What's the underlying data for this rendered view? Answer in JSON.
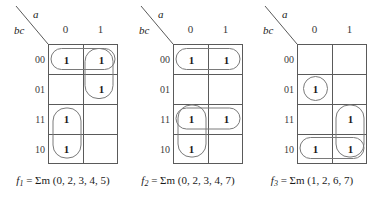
{
  "figure": {
    "type": "karnaugh-maps",
    "count": 3,
    "variables": {
      "column": "a",
      "row": "bc"
    },
    "column_headers": [
      "0",
      "1"
    ],
    "row_headers": [
      "00",
      "01",
      "11",
      "10"
    ],
    "one_label": "1",
    "line_color": "#5a5a5a",
    "group_color": "#7a7a7a",
    "text_color": "#1a1a1a"
  },
  "maps": [
    {
      "id": "map-1",
      "name": "f1",
      "caption": {
        "fn": "f",
        "sub": "1",
        "rest": " = Σm (0, 2, 3, 4, 5)"
      },
      "minterms": [
        0,
        2,
        3,
        4,
        5
      ],
      "cells": [
        {
          "row": "00",
          "col": "0",
          "value": "1"
        },
        {
          "row": "00",
          "col": "1",
          "value": "1"
        },
        {
          "row": "01",
          "col": "0",
          "value": ""
        },
        {
          "row": "01",
          "col": "1",
          "value": "1"
        },
        {
          "row": "11",
          "col": "0",
          "value": "1"
        },
        {
          "row": "11",
          "col": "1",
          "value": ""
        },
        {
          "row": "10",
          "col": "0",
          "value": "1"
        },
        {
          "row": "10",
          "col": "1",
          "value": ""
        }
      ],
      "groups": [
        {
          "name": "group-row00-horizontal",
          "shape": "horizontal-pair",
          "rows": [
            "00"
          ],
          "cols": [
            "0",
            "1"
          ]
        },
        {
          "name": "group-col1-rows00-01",
          "shape": "vertical-pair",
          "rows": [
            "00",
            "01"
          ],
          "cols": [
            "1"
          ]
        },
        {
          "name": "group-col0-rows11-10",
          "shape": "vertical-pair",
          "rows": [
            "11",
            "10"
          ],
          "cols": [
            "0"
          ]
        }
      ]
    },
    {
      "id": "map-2",
      "name": "f2",
      "caption": {
        "fn": "f",
        "sub": "2",
        "rest": " = Σm (0, 2, 3, 4, 7)"
      },
      "minterms": [
        0,
        2,
        3,
        4,
        7
      ],
      "cells": [
        {
          "row": "00",
          "col": "0",
          "value": "1"
        },
        {
          "row": "00",
          "col": "1",
          "value": "1"
        },
        {
          "row": "01",
          "col": "0",
          "value": ""
        },
        {
          "row": "01",
          "col": "1",
          "value": ""
        },
        {
          "row": "11",
          "col": "0",
          "value": "1"
        },
        {
          "row": "11",
          "col": "1",
          "value": "1"
        },
        {
          "row": "10",
          "col": "0",
          "value": "1"
        },
        {
          "row": "10",
          "col": "1",
          "value": ""
        }
      ],
      "groups": [
        {
          "name": "group-row00-horizontal",
          "shape": "horizontal-pair",
          "rows": [
            "00"
          ],
          "cols": [
            "0",
            "1"
          ]
        },
        {
          "name": "group-row11-horizontal",
          "shape": "horizontal-pair",
          "rows": [
            "11"
          ],
          "cols": [
            "0",
            "1"
          ]
        },
        {
          "name": "group-col0-rows11-10",
          "shape": "vertical-pair",
          "rows": [
            "11",
            "10"
          ],
          "cols": [
            "0"
          ]
        }
      ]
    },
    {
      "id": "map-3",
      "name": "f3",
      "caption": {
        "fn": "f",
        "sub": "3",
        "rest": " = Σm (1, 2, 6, 7)"
      },
      "minterms": [
        1,
        2,
        6,
        7
      ],
      "cells": [
        {
          "row": "00",
          "col": "0",
          "value": ""
        },
        {
          "row": "00",
          "col": "1",
          "value": ""
        },
        {
          "row": "01",
          "col": "0",
          "value": "1"
        },
        {
          "row": "01",
          "col": "1",
          "value": ""
        },
        {
          "row": "11",
          "col": "0",
          "value": ""
        },
        {
          "row": "11",
          "col": "1",
          "value": "1"
        },
        {
          "row": "10",
          "col": "0",
          "value": "1"
        },
        {
          "row": "10",
          "col": "1",
          "value": "1"
        }
      ],
      "groups": [
        {
          "name": "group-single-row01-col0",
          "shape": "single",
          "rows": [
            "01"
          ],
          "cols": [
            "0"
          ]
        },
        {
          "name": "group-col1-rows11-10",
          "shape": "vertical-pair",
          "rows": [
            "11",
            "10"
          ],
          "cols": [
            "1"
          ]
        },
        {
          "name": "group-row10-horizontal",
          "shape": "horizontal-pair",
          "rows": [
            "10"
          ],
          "cols": [
            "0",
            "1"
          ]
        }
      ]
    }
  ]
}
